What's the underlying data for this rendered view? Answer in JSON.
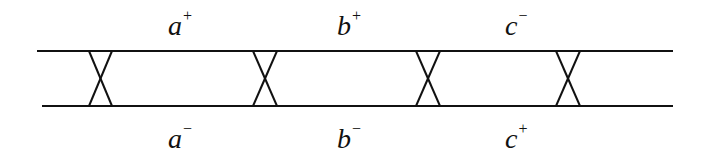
{
  "diagram": {
    "stroke_color": "#111111",
    "background": "#ffffff",
    "rails": [
      {
        "name": "top",
        "x1": 37,
        "x2": 673,
        "y": 51
      },
      {
        "name": "bottom",
        "x1": 42,
        "x2": 673,
        "y": 106
      }
    ],
    "crossings": [
      {
        "x_left": 89,
        "x_right": 112
      },
      {
        "x_left": 253,
        "x_right": 277
      },
      {
        "x_left": 416,
        "x_right": 440
      },
      {
        "x_left": 556,
        "x_right": 580
      }
    ],
    "top_labels": [
      {
        "base": "a",
        "sign": "+"
      },
      {
        "base": "b",
        "sign": "+"
      },
      {
        "base": "c",
        "sign": "−"
      }
    ],
    "bottom_labels": [
      {
        "base": "a",
        "sign": "−"
      },
      {
        "base": "b",
        "sign": "−"
      },
      {
        "base": "c",
        "sign": "+"
      }
    ]
  }
}
